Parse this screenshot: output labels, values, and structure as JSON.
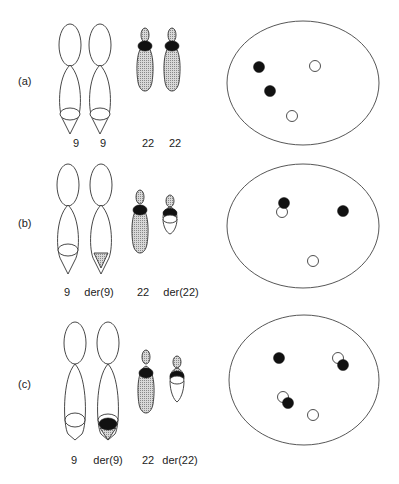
{
  "figure": {
    "panels": [
      {
        "label": "(a)",
        "chromosome_labels": [
          "9",
          "9",
          "22",
          "22"
        ],
        "interphase_signals": {
          "filled": 2,
          "open": 2,
          "fusion": 0
        }
      },
      {
        "label": "(b)",
        "chromosome_labels": [
          "9",
          "der(9)",
          "22",
          "der(22)"
        ],
        "interphase_signals": {
          "filled": 1,
          "open": 1,
          "fusion": 1
        }
      },
      {
        "label": "(c)",
        "chromosome_labels": [
          "9",
          "der(9)",
          "22",
          "der(22)"
        ],
        "interphase_signals": {
          "filled": 1,
          "open": 1,
          "fusion": 2
        }
      }
    ],
    "colors": {
      "outline": "#333333",
      "signal_filled": "#111111",
      "shading": "#bdbdbd"
    }
  }
}
